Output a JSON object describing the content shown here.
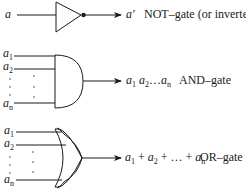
{
  "diagram": {
    "gates": [
      {
        "id": "not",
        "inputs": [
          "a"
        ],
        "output_label": "a′",
        "description": "NOT–gate (or inverter)"
      },
      {
        "id": "and",
        "inputs": [
          "a1",
          "a2",
          "an"
        ],
        "output_label": "a1 a2…an",
        "description": "AND–gate"
      },
      {
        "id": "or",
        "inputs": [
          "a1",
          "a2",
          "an"
        ],
        "output_label": "a1 + a2 + … + an",
        "description": "OR–gate"
      }
    ],
    "symbols": {
      "var": "a",
      "prime": "′",
      "sub1": "1",
      "sub2": "2",
      "subn": "n",
      "ellipsis": "…",
      "plus": " + "
    }
  },
  "colors": {
    "stroke": "#1a1a1a",
    "background": "#ffffff"
  }
}
